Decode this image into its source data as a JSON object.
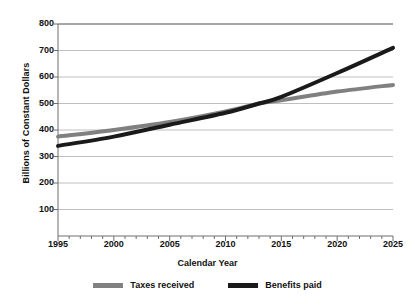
{
  "chart_data": {
    "type": "line",
    "title": "",
    "xlabel": "Calendar Year",
    "ylabel": "Billions of Constant Dollars",
    "xlim": [
      1995,
      2025
    ],
    "ylim": [
      0,
      800
    ],
    "grid": true,
    "grid_axis": "y",
    "legend_position": "bottom",
    "x_tick_labels": [
      "1995",
      "2000",
      "2005",
      "2010",
      "2015",
      "2020",
      "2025"
    ],
    "x_tick_values": [
      1995,
      2000,
      2005,
      2010,
      2015,
      2020,
      2025
    ],
    "x_minor_tick_interval": 1,
    "y_tick_labels": [
      "100",
      "200",
      "300",
      "400",
      "500",
      "600",
      "700",
      "800"
    ],
    "y_tick_values": [
      100,
      200,
      300,
      400,
      500,
      600,
      700,
      800
    ],
    "x": [
      1995,
      2000,
      2005,
      2010,
      2013,
      2015,
      2020,
      2025
    ],
    "series": [
      {
        "name": "Taxes received",
        "color": "#808080",
        "values": [
          375,
          400,
          430,
          470,
          500,
          512,
          545,
          570
        ]
      },
      {
        "name": "Benefits paid",
        "color": "#1a1a1a",
        "values": [
          340,
          375,
          420,
          465,
          500,
          525,
          615,
          710
        ]
      }
    ]
  },
  "axes": {
    "y_title": "Billions of Constant Dollars",
    "x_title": "Calendar Year",
    "y_ticks": [
      "800",
      "700",
      "600",
      "500",
      "400",
      "300",
      "200",
      "100"
    ],
    "x_ticks": [
      "1995",
      "2000",
      "2005",
      "2010",
      "2015",
      "2020",
      "2025"
    ]
  },
  "legend": {
    "items": [
      {
        "label": "Taxes received",
        "color": "#808080"
      },
      {
        "label": "Benefits paid",
        "color": "#1a1a1a"
      }
    ]
  },
  "colors": {
    "background": "#ffffff",
    "axis": "#6e6e6e",
    "gridline": "#b8b8b8",
    "taxes_line": "#808080",
    "benefits_line": "#1a1a1a",
    "text": "#111111"
  }
}
